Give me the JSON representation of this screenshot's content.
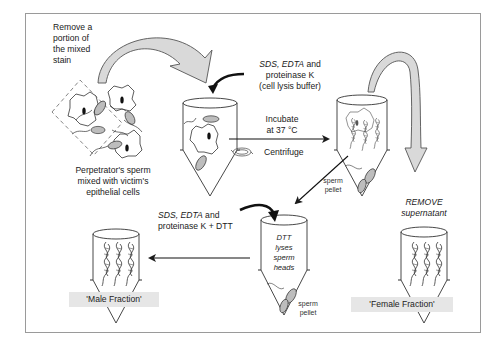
{
  "diagram": {
    "colors": {
      "border": "#9a9a9a",
      "arrow_fill": "#d9d9d9",
      "cell_fill": "#bdbdbd",
      "fraction_bg": "#e6e6e6",
      "ink": "#1a1a1a"
    },
    "labels": {
      "remove_portion": [
        "Remove a",
        "portion of",
        "the mixed",
        "stain"
      ],
      "mixed_cells": [
        "Perpetrator's sperm",
        "mixed with victim's",
        "epithelial cells"
      ],
      "lysis_buffer": {
        "line1_italic": "SDS, EDTA",
        "line1_rest": " and",
        "line2": "proteinase K",
        "line3": "(cell lysis buffer)"
      },
      "incubate": [
        "Incubate",
        "at 37 °C"
      ],
      "centrifuge": "Centrifuge",
      "sperm_pellet_top": [
        "sperm",
        "pellet"
      ],
      "remove_supernatant": [
        "REMOVE",
        "supernatant"
      ],
      "dtt_buffer": {
        "line1_italic": "SDS, EDTA",
        "line1_rest": " and",
        "line2": "proteinase K + DTT"
      },
      "dtt_lyses": [
        "DTT",
        "lyses",
        "sperm",
        "heads"
      ],
      "sperm_pellet_bottom": [
        "sperm",
        "pellet"
      ],
      "male_fraction": "'Male Fraction'",
      "female_fraction": "'Female Fraction'"
    },
    "nodes": [
      {
        "id": "mixed-stain",
        "label": "Perpetrator's sperm mixed with victim's epithelial cells"
      },
      {
        "id": "tube-lysis",
        "label": "Tube with cells + lysis buffer"
      },
      {
        "id": "tube-centrifuged",
        "label": "Tube after incubation and centrifuge, sperm pellet"
      },
      {
        "id": "tube-female",
        "label": "'Female Fraction'"
      },
      {
        "id": "tube-dtt",
        "label": "DTT lyses sperm heads"
      },
      {
        "id": "tube-male",
        "label": "'Male Fraction'"
      }
    ],
    "edges": [
      {
        "from": "mixed-stain",
        "to": "tube-lysis",
        "label": "Remove a portion of the mixed stain"
      },
      {
        "from": "tube-lysis",
        "to": "tube-centrifuged",
        "label": "Incubate at 37 °C / Centrifuge"
      },
      {
        "from": "tube-centrifuged",
        "to": "tube-female",
        "label": "REMOVE supernatant"
      },
      {
        "from": "tube-centrifuged",
        "to": "tube-dtt",
        "label": "sperm pellet"
      },
      {
        "from": "tube-dtt",
        "to": "tube-male",
        "label": ""
      }
    ]
  }
}
